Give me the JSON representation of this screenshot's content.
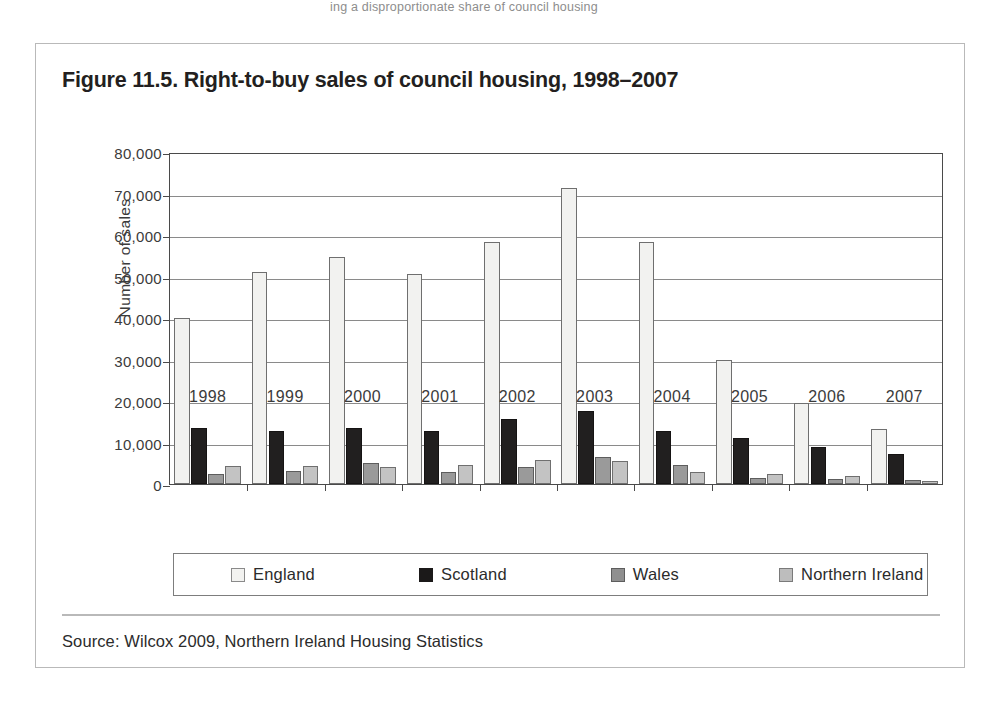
{
  "page": {
    "top_caption": "ing a disproportionate share of council housing"
  },
  "figure": {
    "title": "Figure 11.5. Right-to-buy sales of council housing, 1998–2007",
    "source": "Source: Wilcox 2009, Northern Ireland Housing Statistics"
  },
  "colors": {
    "england": "#f2f2f0",
    "scotland": "#211f1f",
    "wales": "#9a9a9a",
    "northern_ireland": "#c3c3c3",
    "axis": "#4a4a4a",
    "grid": "#8a8a8a",
    "border": "#b9b9b9"
  },
  "chart_data": {
    "type": "bar",
    "title": "Figure 11.5. Right-to-buy sales of council housing, 1998–2007",
    "xlabel": "",
    "ylabel": "Number of sales",
    "ylim": [
      0,
      80000
    ],
    "ytick_labels": [
      "80,000",
      "70,000",
      "60,000",
      "50,000",
      "40,000",
      "30,000",
      "20,000",
      "10,000",
      "0"
    ],
    "ytick_values": [
      80000,
      70000,
      60000,
      50000,
      40000,
      30000,
      20000,
      10000,
      0
    ],
    "grid": true,
    "legend_position": "bottom",
    "categories": [
      "1998",
      "1999",
      "2000",
      "2001",
      "2002",
      "2003",
      "2004",
      "2005",
      "2006",
      "2007"
    ],
    "series": [
      {
        "name": "England",
        "key": "eng",
        "color": "#f2f2f0",
        "values": [
          40000,
          51000,
          54700,
          50500,
          58300,
          71300,
          58300,
          30000,
          19500,
          13300
        ]
      },
      {
        "name": "Scotland",
        "key": "sco",
        "color": "#211f1f",
        "values": [
          13500,
          12700,
          13400,
          12700,
          15600,
          17500,
          12700,
          11000,
          8800,
          7200
        ]
      },
      {
        "name": "Wales",
        "key": "wal",
        "color": "#9a9a9a",
        "values": [
          2400,
          3100,
          5000,
          3000,
          4100,
          6600,
          4600,
          1500,
          1100,
          900
        ]
      },
      {
        "name": "Northern Ireland",
        "key": "ni",
        "color": "#c3c3c3",
        "values": [
          4300,
          4300,
          4000,
          4700,
          5800,
          5600,
          2900,
          2300,
          1900,
          700
        ]
      }
    ]
  }
}
